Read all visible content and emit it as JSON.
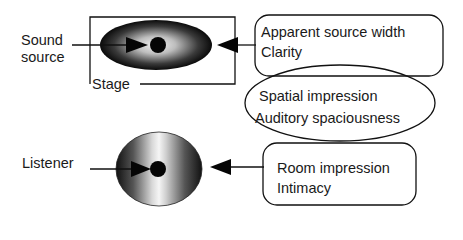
{
  "diagram": {
    "source": {
      "label_line1": "Sound",
      "label_line2": "source",
      "stage_label": "Stage"
    },
    "listener": {
      "label": "Listener"
    },
    "box_top": {
      "line1": "Apparent source width",
      "line2": "Clarity"
    },
    "ellipse_middle": {
      "line1": "Spatial impression",
      "line2": "Auditory spaciousness"
    },
    "box_bottom": {
      "line1": "Room impression",
      "line2": "Intimacy"
    },
    "colors": {
      "stroke": "#111111",
      "background": "#ffffff"
    }
  }
}
